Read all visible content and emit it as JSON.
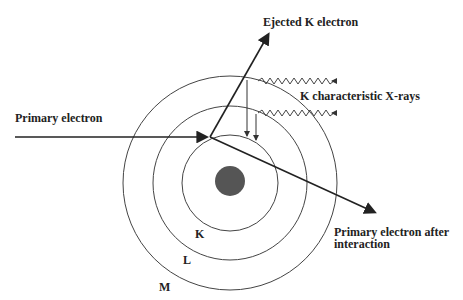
{
  "labels": {
    "ejected": "Ejected K electron",
    "xrays": "K characteristic X-rays",
    "primary": "Primary electron",
    "after_line1": "Primary electron after",
    "after_line2": "interaction",
    "shell_k": "K",
    "shell_l": "L",
    "shell_m": "M"
  },
  "colors": {
    "line": "#222222",
    "nucleus": "#555555"
  }
}
